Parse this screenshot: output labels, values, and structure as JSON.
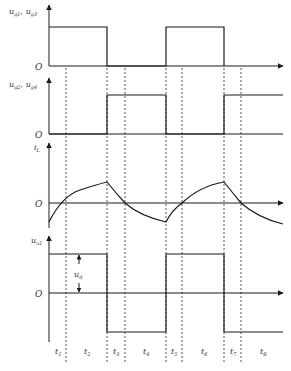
{
  "figure": {
    "type": "timing-waveform-diagram",
    "panels": [
      {
        "id": "gate-1-3",
        "y_label": "u_g1, u_g3",
        "y_label_main": "u",
        "y_label_parts": [
          {
            "sub": "g1"
          },
          {
            "sep": ", "
          },
          {
            "main": "u"
          },
          {
            "sub": "g3"
          }
        ],
        "origin_label": "O",
        "waveform": "square",
        "levels": [
          "high",
          "low",
          "high",
          "low"
        ]
      },
      {
        "id": "gate-2-4",
        "y_label": "u_g2, u_g4",
        "origin_label": "O",
        "waveform": "square-complement",
        "levels": [
          "low",
          "high",
          "low",
          "high"
        ]
      },
      {
        "id": "inductor-current",
        "y_label": "i_L",
        "origin_label": "O",
        "waveform": "exponential-triangle"
      },
      {
        "id": "output-voltage",
        "y_label": "u_o1",
        "origin_label": "O",
        "waveform": "bipolar-square",
        "annotation": "u_d",
        "levels": [
          "+u_d",
          "-u_d",
          "+u_d",
          "-u_d"
        ]
      }
    ],
    "intervals": [
      "t1",
      "t2",
      "t3",
      "t4",
      "t5",
      "t6",
      "t7",
      "t8"
    ],
    "interval_labels": [
      {
        "main": "t",
        "sub": "1"
      },
      {
        "main": "t",
        "sub": "2"
      },
      {
        "main": "t",
        "sub": "3"
      },
      {
        "main": "t",
        "sub": "4"
      },
      {
        "main": "t",
        "sub": "5"
      },
      {
        "main": "t",
        "sub": "6"
      },
      {
        "main": "t",
        "sub": "7"
      },
      {
        "main": "t",
        "sub": "8"
      }
    ],
    "labels": {
      "p1_main": "u",
      "p1_sub1": "g1",
      "p1_sep": ", ",
      "p1_main2": "u",
      "p1_sub2": "g3",
      "p2_main": "u",
      "p2_sub1": "g2",
      "p2_sep": ", ",
      "p2_main2": "u",
      "p2_sub2": "g4",
      "p3_main": "i",
      "p3_sub": "L",
      "p4_main": "u",
      "p4_sub": "o1",
      "origin": "O",
      "ud_main": "u",
      "ud_sub": "d"
    },
    "colors": {
      "line": "#1a1a1a",
      "dashed": "#555555",
      "axis": "#333333"
    }
  }
}
